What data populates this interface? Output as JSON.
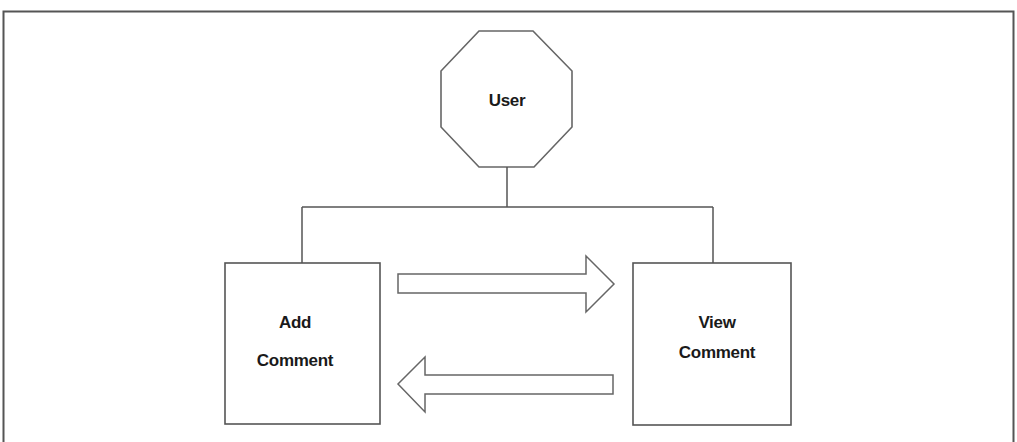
{
  "figure": {
    "caption_visible": "",
    "frame": {
      "stroke": "#555555"
    }
  },
  "nodes": {
    "user": {
      "label": "User",
      "shape": "octagon"
    },
    "add_comment": {
      "label_line1": "Add",
      "label_line2": "Comment",
      "shape": "rectangle"
    },
    "view_comment": {
      "label_line1": "View",
      "label_line2": "Comment",
      "shape": "rectangle"
    }
  },
  "edges": [
    {
      "from": "user",
      "to": "add_comment",
      "type": "line"
    },
    {
      "from": "user",
      "to": "view_comment",
      "type": "line"
    },
    {
      "from": "add_comment",
      "to": "view_comment",
      "type": "block-arrow-right"
    },
    {
      "from": "view_comment",
      "to": "add_comment",
      "type": "block-arrow-left"
    }
  ],
  "colors": {
    "stroke": "#5a5a5a",
    "text": "#1a1a1a",
    "background": "#ffffff"
  }
}
